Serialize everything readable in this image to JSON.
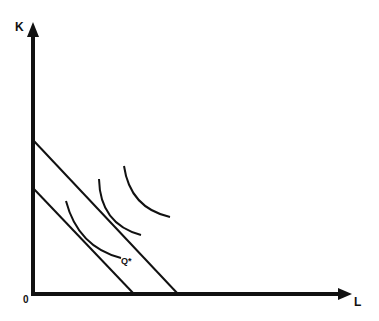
{
  "diagram": {
    "type": "isoquant-isocost",
    "axes": {
      "y_label": "K",
      "x_label": "L",
      "origin_label": "0"
    },
    "isoquant_label": "Q*",
    "isocost_lines": [
      {
        "name": "lower-isocost",
        "from": [
          33,
          188
        ],
        "to": [
          134,
          294
        ]
      },
      {
        "name": "upper-isocost",
        "from": [
          33,
          140
        ],
        "to": [
          178,
          294
        ]
      }
    ],
    "isoquants": [
      {
        "name": "isoquant-q-star",
        "label": "Q*"
      },
      {
        "name": "isoquant-middle"
      },
      {
        "name": "isoquant-outer"
      }
    ],
    "colors": {
      "line": "#111111",
      "background": "#ffffff"
    }
  }
}
